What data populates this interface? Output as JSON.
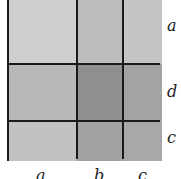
{
  "diagram": {
    "column_labels": [
      "a",
      "b",
      "c"
    ],
    "row_labels": [
      "a",
      "d",
      "c"
    ],
    "cells": [
      [
        {
          "color": "#cfcfcf"
        },
        {
          "color": "#bdbdbd"
        },
        {
          "color": "#c4c4c4"
        }
      ],
      [
        {
          "color": "#b8b8b8"
        },
        {
          "color": "#8f8f8f"
        },
        {
          "color": "#a3a3a3"
        }
      ],
      [
        {
          "color": "#c2c2c2"
        },
        {
          "color": "#a2a2a2"
        },
        {
          "color": "#a8a8a8"
        }
      ]
    ]
  }
}
